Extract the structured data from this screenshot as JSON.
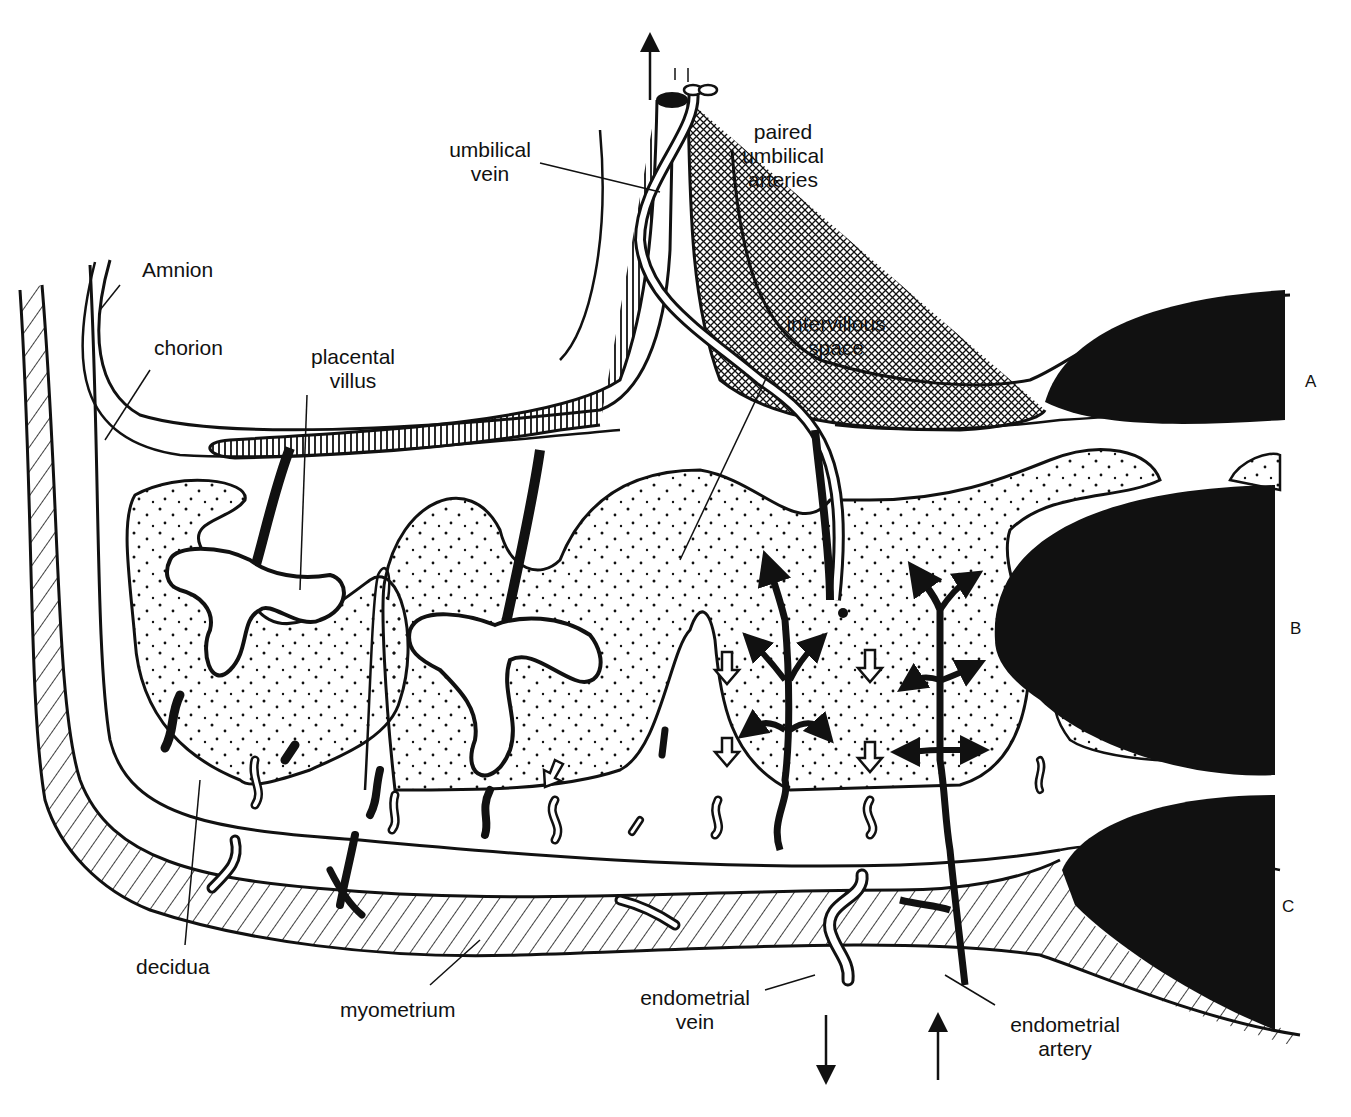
{
  "figure": {
    "ink_color": "#111111",
    "paper_color": "#ffffff"
  },
  "labels": {
    "umbilical_vein": {
      "line1": "umbilical",
      "line2": "vein"
    },
    "paired_umbilical_arteries": {
      "line1": "paired",
      "line2": "umbilical",
      "line3": "arteries"
    },
    "amnion": {
      "text": "Amnion"
    },
    "chorion": {
      "text": "chorion"
    },
    "placental_villus": {
      "line1": "placental",
      "line2": "villus"
    },
    "intervillous_space": {
      "line1": "intervillous",
      "line2": "space"
    },
    "decidua": {
      "text": "decidua"
    },
    "myometrium": {
      "text": "myometrium"
    },
    "endometrial_vein": {
      "line1": "endometrial",
      "line2": "vein"
    },
    "endometrial_artery": {
      "line1": "endometrial",
      "line2": "artery"
    }
  },
  "zones": [
    {
      "id": "A",
      "label": "A"
    },
    {
      "id": "B",
      "label": "B"
    },
    {
      "id": "C",
      "label": "C"
    }
  ],
  "flow_arrows": {
    "umbilical_out": "up",
    "endometrial_vein_flow": "down",
    "endometrial_artery_flow": "up"
  }
}
